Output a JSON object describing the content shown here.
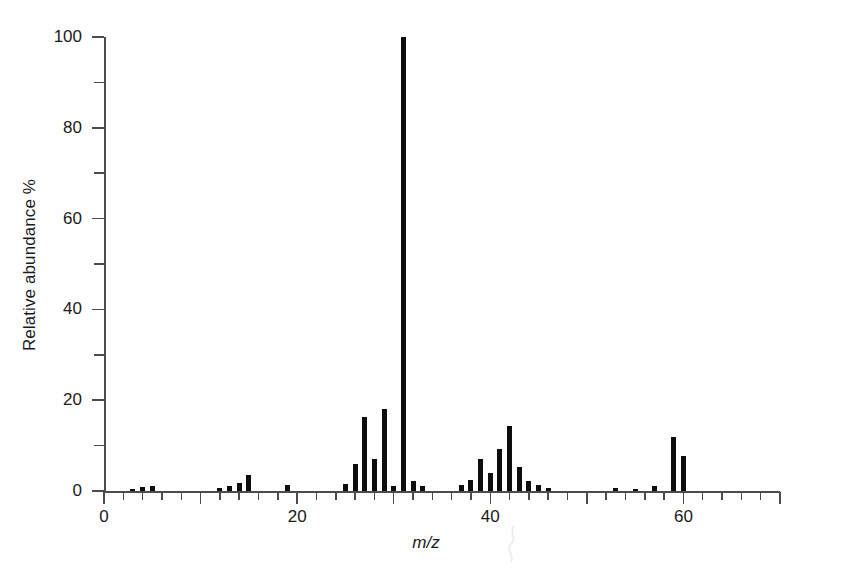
{
  "chart_data": {
    "type": "bar",
    "title": "",
    "subtitle": "",
    "xlabel": "m/z",
    "ylabel": "Relative abundance %",
    "xlim": [
      0,
      70
    ],
    "ylim": [
      0,
      100
    ],
    "grid": false,
    "legend": null,
    "x_major_ticks": [
      0,
      10,
      20,
      30,
      40,
      50,
      60,
      70
    ],
    "x_tick_labels": [
      "0",
      "20",
      "40",
      "60"
    ],
    "x_labeled_ticks": [
      0,
      20,
      40,
      60
    ],
    "x_minor_tick_step": 2,
    "y_major_ticks": [
      0,
      20,
      40,
      60,
      80,
      100
    ],
    "y_tick_labels": [
      "0",
      "20",
      "40",
      "60",
      "80",
      "100"
    ],
    "y_minor_ticks": [
      10,
      30,
      50,
      70,
      90
    ],
    "bar_color": "#0d0d0d",
    "axis_color": "#4c4c4c",
    "background_color": "#fefefe",
    "base_peak_mz": 31,
    "x": [
      3,
      4,
      5,
      12,
      13,
      14,
      15,
      19,
      25,
      26,
      27,
      28,
      29,
      30,
      31,
      32,
      33,
      37,
      38,
      39,
      40,
      41,
      42,
      43,
      44,
      45,
      46,
      53,
      55,
      57,
      59,
      60
    ],
    "values": [
      0.5,
      0.8,
      1.0,
      0.6,
      1.2,
      1.8,
      3.5,
      1.3,
      1.5,
      6.0,
      16.2,
      7.0,
      18.0,
      1.0,
      100.0,
      2.2,
      1.2,
      1.4,
      2.5,
      7.0,
      4.0,
      9.3,
      14.4,
      5.2,
      2.2,
      1.4,
      0.6,
      0.7,
      0.5,
      1.1,
      12.0,
      7.6
    ],
    "labels": [
      "3",
      "4",
      "5",
      "12",
      "13",
      "14",
      "15",
      "19",
      "25",
      "26",
      "27",
      "28",
      "29",
      "30",
      "31",
      "32",
      "33",
      "37",
      "38",
      "39",
      "40",
      "41",
      "42",
      "43",
      "44",
      "45",
      "46",
      "53",
      "55",
      "57",
      "59",
      "60"
    ]
  },
  "axes": {
    "y_title": "Relative abundance %",
    "x_title": "m/z"
  }
}
